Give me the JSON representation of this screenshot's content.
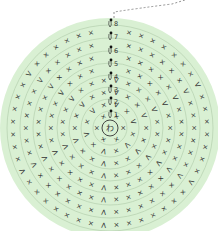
{
  "diagram": {
    "type": "crochet-round-chart",
    "center_label": "わ",
    "round_labels": [
      "1",
      "2",
      "3",
      "4",
      "5",
      "6",
      "7",
      "8"
    ],
    "colors": {
      "background": "#ffffff",
      "fill": "#d9f0d3",
      "ring_stroke": "#b9d3b3",
      "symbol": "#333333",
      "dash": "#777777"
    },
    "center": {
      "x": 110,
      "y": 128
    },
    "center_ring_radius": 6,
    "ring_radii": [
      17,
      29,
      41,
      53,
      65,
      77,
      90,
      103
    ],
    "outer_radius": 110,
    "label_y": [
      114,
      101,
      89,
      76,
      63,
      50,
      36,
      23
    ],
    "stitch_counts": [
      6,
      12,
      18,
      24,
      30,
      36,
      42,
      48
    ],
    "symbols": {
      "single_crochet": "×",
      "increase": "V",
      "chain_start": "ↄ"
    }
  }
}
